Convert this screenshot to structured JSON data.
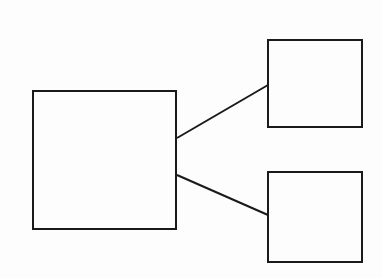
{
  "diagram": {
    "background": "#fdfdfd",
    "stroke_color": "#1a1a1a",
    "stroke_width": 2,
    "nodes": [
      {
        "id": "parent",
        "x": 33,
        "y": 91,
        "width": 143,
        "height": 138
      },
      {
        "id": "child-top",
        "x": 268,
        "y": 40,
        "width": 94,
        "height": 87
      },
      {
        "id": "child-bottom",
        "x": 268,
        "y": 172,
        "width": 94,
        "height": 90
      }
    ],
    "edges": [
      {
        "from": "parent",
        "to": "child-top",
        "x1": 177,
        "y1": 138,
        "x2": 268,
        "y2": 85
      },
      {
        "from": "parent",
        "to": "child-bottom",
        "x1": 177,
        "y1": 175,
        "x2": 268,
        "y2": 215
      }
    ]
  }
}
